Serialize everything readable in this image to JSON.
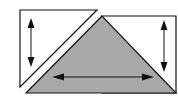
{
  "diagram": {
    "colors": {
      "stroke": "#111111",
      "fill_white": "#ffffff",
      "fill_gray": "#a8a8a8",
      "background": "#ffffff"
    },
    "shapes": [
      {
        "id": "left-triangle",
        "fill": "white",
        "points": [
          [
            20,
            10
          ],
          [
            97,
            10
          ],
          [
            20,
            87
          ]
        ]
      },
      {
        "id": "gray-triangle",
        "fill": "gray",
        "points": [
          [
            102,
            16
          ],
          [
            26,
            93
          ],
          [
            176,
            93
          ]
        ]
      },
      {
        "id": "right-quad",
        "fill": "white",
        "points": [
          [
            102,
            16
          ],
          [
            176,
            16
          ],
          [
            176,
            93
          ]
        ]
      }
    ],
    "arrows": [
      {
        "id": "left-vertical-arrow",
        "orientation": "vertical",
        "from": [
          31,
          20
        ],
        "to": [
          31,
          65
        ]
      },
      {
        "id": "right-vertical-arrow",
        "orientation": "vertical",
        "from": [
          164,
          22
        ],
        "to": [
          164,
          70
        ]
      },
      {
        "id": "bottom-horizontal-arrow",
        "orientation": "horizontal",
        "from": [
          53,
          77
        ],
        "to": [
          152,
          77
        ]
      }
    ]
  }
}
